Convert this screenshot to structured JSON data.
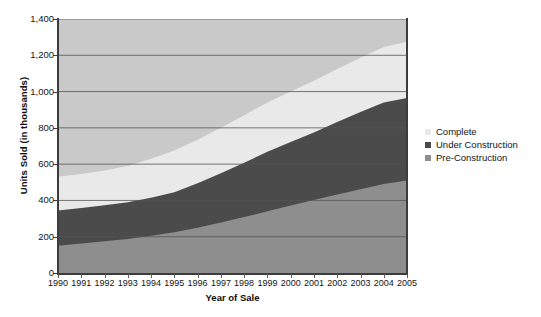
{
  "chart_data": {
    "type": "area",
    "stacked": true,
    "title": "",
    "xlabel": "Year of Sale",
    "ylabel": "Units Sold (in thousands)",
    "categories": [
      1990,
      1991,
      1992,
      1993,
      1994,
      1995,
      1996,
      1997,
      1998,
      1999,
      2000,
      2001,
      2002,
      2003,
      2004,
      2005
    ],
    "xtick_labels": [
      "1990",
      "1991",
      "1992",
      "1993",
      "1994",
      "1995",
      "1996",
      "1997",
      "1998",
      "1999",
      "2000",
      "2001",
      "2002",
      "2003",
      "2004",
      "2005"
    ],
    "ytick_labels": [
      "0",
      "200",
      "400",
      "600",
      "800",
      "1,000",
      "1,200",
      "1,400"
    ],
    "ytick_values": [
      0,
      200,
      400,
      600,
      800,
      1000,
      1200,
      1400
    ],
    "ylim": [
      0,
      1400
    ],
    "xlim": [
      1990,
      2005
    ],
    "grid": "horizontal",
    "legend_position": "right",
    "plot_background": "#c9c9c9",
    "series": [
      {
        "name": "Pre-Construction",
        "color": "#8e8e8e",
        "values": [
          150,
          162,
          175,
          188,
          205,
          225,
          250,
          278,
          308,
          340,
          372,
          402,
          432,
          462,
          490,
          510
        ]
      },
      {
        "name": "Under Construction",
        "color": "#4b4b4b",
        "values": [
          195,
          196,
          198,
          202,
          210,
          220,
          245,
          272,
          300,
          328,
          350,
          372,
          400,
          425,
          450,
          455
        ]
      },
      {
        "name": "Complete",
        "color": "#e9e9e9",
        "values": [
          185,
          188,
          192,
          200,
          215,
          230,
          240,
          250,
          262,
          272,
          278,
          286,
          293,
          300,
          305,
          310
        ]
      }
    ],
    "cumulative_totals": [
      530,
      546,
      565,
      590,
      630,
      675,
      735,
      800,
      870,
      940,
      1000,
      1060,
      1125,
      1187,
      1245,
      1275
    ],
    "legend_entries": [
      {
        "label": "Complete",
        "color": "#e9e9e9"
      },
      {
        "label": "Under Construction",
        "color": "#4b4b4b"
      },
      {
        "label": "Pre-Construction",
        "color": "#8e8e8e"
      }
    ]
  }
}
